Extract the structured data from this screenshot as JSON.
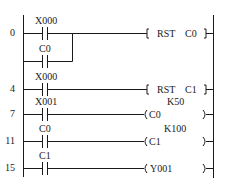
{
  "diagram": {
    "type": "ladder",
    "rungs": [
      {
        "step": "0",
        "contacts": [
          {
            "label": "X000"
          },
          {
            "label": "C0",
            "parallel": true
          }
        ],
        "output": {
          "kind": "instruction",
          "op": "RST",
          "operand": "C0"
        }
      },
      {
        "step": "4",
        "contacts": [
          {
            "label": "X000"
          }
        ],
        "output": {
          "kind": "instruction",
          "op": "RST",
          "operand": "C1"
        }
      },
      {
        "step": "7",
        "contacts": [
          {
            "label": "X001"
          }
        ],
        "output": {
          "kind": "coil",
          "name": "C0",
          "preset": "K50"
        }
      },
      {
        "step": "11",
        "contacts": [
          {
            "label": "C0"
          }
        ],
        "output": {
          "kind": "coil",
          "name": "C1",
          "preset": "K100"
        }
      },
      {
        "step": "15",
        "contacts": [
          {
            "label": "C1"
          }
        ],
        "output": {
          "kind": "coil",
          "name": "Y001"
        }
      }
    ]
  },
  "labels": {
    "r0_step": "0",
    "r0_contact": "X000",
    "r0_branch": "C0",
    "r0_op": "RST",
    "r0_operand": "C0",
    "r1_step": "4",
    "r1_contact": "X000",
    "r1_op": "RST",
    "r1_operand": "C1",
    "r2_step": "7",
    "r2_contact": "X001",
    "r2_preset": "K50",
    "r2_coil": "C0",
    "r3_step": "11",
    "r3_contact": "C0",
    "r3_preset": "K100",
    "r3_coil": "C1",
    "r4_step": "15",
    "r4_contact": "C1",
    "r4_coil": "Y001"
  },
  "colors": {
    "line": "#1a1a1a",
    "background": "#ffffff"
  }
}
